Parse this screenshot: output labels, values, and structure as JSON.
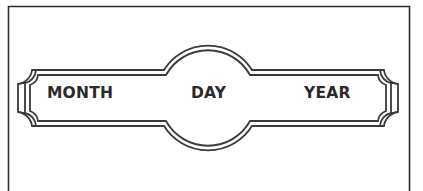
{
  "form": {
    "date_banner": {
      "fields": [
        {
          "key": "month",
          "label": "MONTH"
        },
        {
          "key": "day",
          "label": "DAY"
        },
        {
          "key": "year",
          "label": "YEAR"
        }
      ]
    }
  },
  "colors": {
    "stroke": "#3a3a3a",
    "background": "#ffffff",
    "text": "#2b2b2b"
  }
}
